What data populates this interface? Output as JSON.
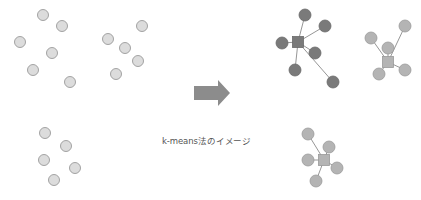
{
  "caption": "k-means法のイメージ",
  "colors": {
    "raw_fill": "#dcdcdc",
    "raw_stroke": "#9a9a9a",
    "cluster_dark_fill": "#7a7a7a",
    "cluster_dark_stroke": "#6a6a6a",
    "cluster_light_fill": "#b4b4b4",
    "cluster_light_stroke": "#9a9a9a",
    "line": "#8a8a8a",
    "arrow": "#8c8c8c"
  },
  "before": {
    "points": [
      [
        43,
        15
      ],
      [
        62,
        26
      ],
      [
        20,
        42
      ],
      [
        52,
        53
      ],
      [
        33,
        70
      ],
      [
        70,
        82
      ],
      [
        142,
        26
      ],
      [
        108,
        39
      ],
      [
        125,
        48
      ],
      [
        138,
        61
      ],
      [
        116,
        74
      ],
      [
        45,
        133
      ],
      [
        66,
        146
      ],
      [
        44,
        160
      ],
      [
        75,
        168
      ],
      [
        54,
        180
      ]
    ]
  },
  "after": {
    "clusters": [
      {
        "name": "cluster-1",
        "tone": "dark",
        "center": [
          298,
          42
        ],
        "points": [
          [
            305,
            15
          ],
          [
            325,
            26
          ],
          [
            282,
            43
          ],
          [
            315,
            53
          ],
          [
            295,
            70
          ],
          [
            333,
            82
          ]
        ]
      },
      {
        "name": "cluster-2",
        "tone": "light",
        "center": [
          388,
          62
        ],
        "points": [
          [
            371,
            38
          ],
          [
            405,
            26
          ],
          [
            388,
            48
          ],
          [
            379,
            74
          ],
          [
            405,
            70
          ]
        ]
      },
      {
        "name": "cluster-3",
        "tone": "light",
        "center": [
          324,
          160
        ],
        "points": [
          [
            308,
            134
          ],
          [
            329,
            147
          ],
          [
            308,
            160
          ],
          [
            337,
            168
          ],
          [
            316,
            181
          ]
        ]
      }
    ]
  },
  "arrow": {
    "x1": 194,
    "x2": 230,
    "y": 93,
    "body_h": 14,
    "head_h": 26,
    "head_len": 12
  }
}
